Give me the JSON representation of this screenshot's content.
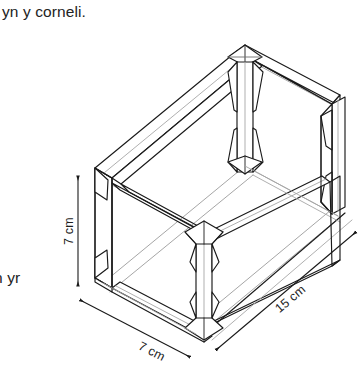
{
  "page": {
    "background_color": "#ffffff",
    "width": 360,
    "height": 382
  },
  "text": {
    "caption_top": "yn y corneli.",
    "caption_left": "n yr"
  },
  "figure": {
    "name": "isometric-box-frame",
    "line_color_primary": "#1a1a1a",
    "line_color_secondary": "#9a9a9a",
    "fill_color": "#ffffff"
  },
  "dimensions": [
    {
      "id": "height",
      "label": "7 cm",
      "orientation": "vertical",
      "value": 7,
      "unit": "cm"
    },
    {
      "id": "depth",
      "label": "7 cm",
      "orientation": "diagonal-left",
      "value": 7,
      "unit": "cm"
    },
    {
      "id": "length",
      "label": "15 cm",
      "orientation": "diagonal-right",
      "value": 15,
      "unit": "cm"
    }
  ]
}
